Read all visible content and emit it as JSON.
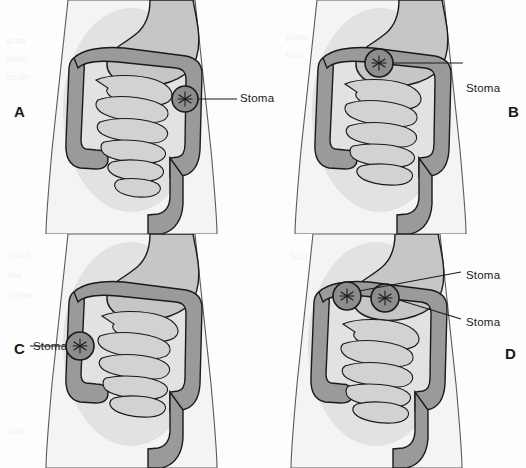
{
  "figure": {
    "type": "medical-illustration",
    "panel_count": 4,
    "layout": "2x2 grid"
  },
  "colors": {
    "body_fill": "#f4f4f4",
    "body_outline": "#4d4d4d",
    "abdomen_shadow": "#dcdcdc",
    "colon_fill": "#9a9a9a",
    "small_intestine_fill": "#cdcdcd",
    "stomach_fill": "#c4c4c4",
    "outline": "#1a1a1a",
    "stoma_fill": "#8a8a8a",
    "label_text": "#1a1a1a",
    "background": "#fdfdfd"
  },
  "panels": [
    {
      "letter": "A",
      "letter_position": "left",
      "description": "Descending colostomy - stoma on left lower descending colon",
      "stomas": [
        {
          "label": "Stoma",
          "label_side": "right",
          "site": "descending-colon"
        }
      ]
    },
    {
      "letter": "B",
      "letter_position": "right",
      "description": "Transverse colostomy - single stoma on transverse colon",
      "stomas": [
        {
          "label": "Stoma",
          "label_side": "right",
          "site": "transverse-colon"
        }
      ]
    },
    {
      "letter": "C",
      "letter_position": "left",
      "description": "Ascending colostomy - stoma on right ascending colon",
      "stomas": [
        {
          "label": "Stoma",
          "label_side": "left",
          "site": "ascending-colon"
        }
      ]
    },
    {
      "letter": "D",
      "letter_position": "right",
      "description": "Double-barrel transverse colostomy - two stomas on transverse colon",
      "stomas": [
        {
          "label": "Stoma",
          "label_side": "right",
          "site": "transverse-colon-proximal"
        },
        {
          "label": "Stoma",
          "label_side": "right",
          "site": "transverse-colon-distal"
        }
      ]
    }
  ],
  "bleed_text": [
    "scan",
    "from",
    "under",
    "plate",
    "tion",
    "color",
    "the",
    "pages",
    "fold",
    "bind",
    "rule",
    "item"
  ]
}
